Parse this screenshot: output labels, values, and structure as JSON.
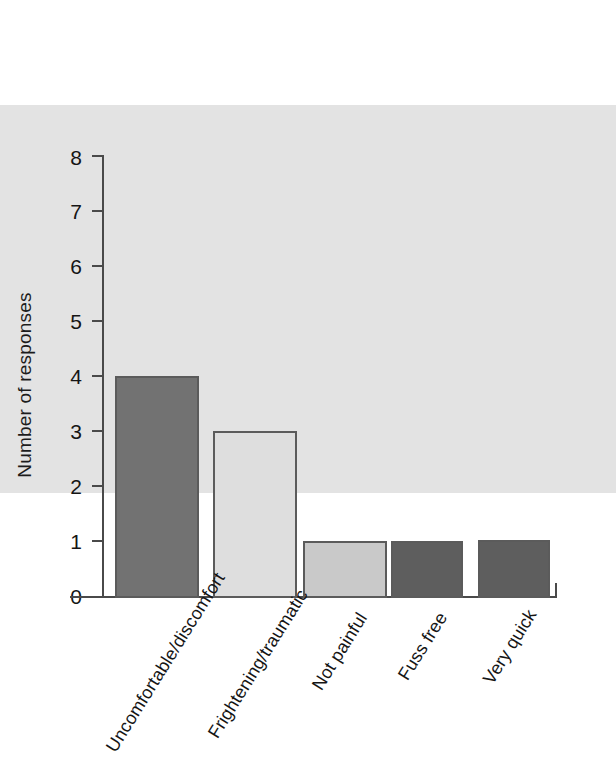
{
  "chart_data": {
    "type": "bar",
    "title": "",
    "xlabel": "",
    "ylabel": "Number of responses",
    "ylim": [
      0,
      8
    ],
    "ytick_labels": [
      "8",
      "7",
      "6",
      "5",
      "4",
      "3",
      "2",
      "1",
      "0"
    ],
    "yticks": [
      8,
      7,
      6,
      5,
      4,
      3,
      2,
      1,
      0
    ],
    "grid": false,
    "legend": "none",
    "categories": [
      "Uncomfortable/discomfort",
      "Frightening/traumatic",
      "Not painful",
      "Fuss free",
      "Very quick"
    ],
    "values": [
      7,
      4,
      3,
      1,
      1
    ],
    "bar_colors": [
      "#e3e3e3",
      "#727272",
      "#dedede",
      "#c9c9c9",
      "#5e5e5e"
    ],
    "bar_border_color": "#5b5b5b",
    "axis_color": "#4a4a4a",
    "background_color": "#ffffff",
    "label_rotation_deg": -58
  }
}
